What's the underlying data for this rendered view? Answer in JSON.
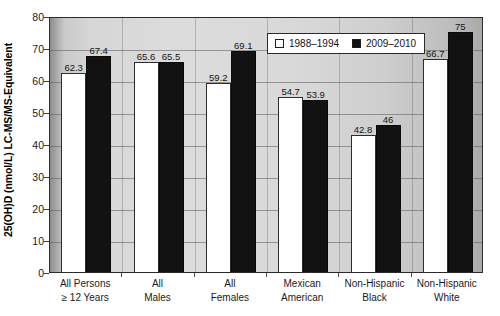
{
  "chart_data": {
    "type": "bar",
    "title": "",
    "xlabel": "",
    "ylabel": "25(OH)D (nmol/L) LC-MS/MS-Equivalent",
    "ylim": [
      0,
      80
    ],
    "ytick_step": 10,
    "yticks": [
      "80",
      "70",
      "60",
      "50",
      "40",
      "30",
      "20",
      "10",
      "0"
    ],
    "grid": true,
    "legend_position": "top-right-inside",
    "categories": [
      "All Persons ≥ 12 Years",
      "All Males",
      "All Females",
      "Mexican American",
      "Non-Hispanic Black",
      "Non-Hispanic White"
    ],
    "category_lines": [
      {
        "line1": "All Persons",
        "line2": "≥ 12 Years"
      },
      {
        "line1": "All",
        "line2": "Males"
      },
      {
        "line1": "All",
        "line2": "Females"
      },
      {
        "line1": "Mexican",
        "line2": "American"
      },
      {
        "line1": "Non-Hispanic",
        "line2": "Black"
      },
      {
        "line1": "Non-Hispanic",
        "line2": "White"
      }
    ],
    "series": [
      {
        "name": "1988–1994",
        "color": "#ffffff",
        "values": [
          62.3,
          65.6,
          59.2,
          54.7,
          42.8,
          66.7
        ],
        "labels": [
          "62.3",
          "65.6",
          "59.2",
          "54.7",
          "42.8",
          "66.7"
        ]
      },
      {
        "name": "2009–2010",
        "color": "#121212",
        "values": [
          67.4,
          65.5,
          69.1,
          53.9,
          46.0,
          75.0
        ],
        "labels": [
          "67.4",
          "65.5",
          "69.1",
          "53.9",
          "46",
          "75"
        ]
      }
    ]
  },
  "legend": {
    "entries": [
      {
        "label": "1988–1994",
        "swatch": "light"
      },
      {
        "label": "2009–2010",
        "swatch": "dark"
      }
    ]
  }
}
